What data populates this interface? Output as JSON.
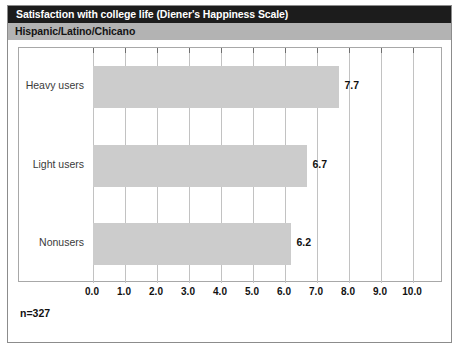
{
  "chart_data": {
    "type": "bar",
    "orientation": "horizontal",
    "title": "Satisfaction with college life (Diener's Happiness Scale)",
    "subtitle": "Hispanic/Latino/Chicano",
    "categories": [
      "Heavy users",
      "Light users",
      "Nonusers"
    ],
    "values": [
      7.7,
      6.7,
      6.2
    ],
    "value_labels": [
      "7.7",
      "6.7",
      "6.2"
    ],
    "xlabel": "",
    "ylabel": "",
    "xlim": [
      0.0,
      10.0
    ],
    "xtick_labels": [
      "0.0",
      "1.0",
      "2.0",
      "3.0",
      "4.0",
      "5.0",
      "6.0",
      "7.0",
      "8.0",
      "9.0",
      "10.0"
    ],
    "xtick_values": [
      0,
      1,
      2,
      3,
      4,
      5,
      6,
      7,
      8,
      9,
      10
    ],
    "grid": true,
    "legend": "none",
    "footnote": "n=327",
    "colors": {
      "bar_fill": "#cccccc",
      "title_bar": "#1c1c1c",
      "title_text": "#ffffff",
      "subtitle_bar": "#b3b3b3",
      "subtitle_text": "#141414",
      "gridline": "#c2c2c2",
      "frame": "#a8a8a8",
      "background": "#ffffff"
    }
  }
}
